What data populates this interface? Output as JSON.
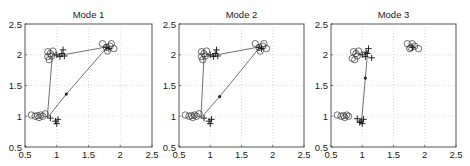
{
  "chart_data": [
    {
      "type": "scatter",
      "title": "Mode 1",
      "xlabel": "",
      "ylabel": "",
      "xlim": [
        0.5,
        2.5
      ],
      "ylim": [
        0.5,
        2.5
      ],
      "xticks": [
        "0.5",
        "1",
        "1.5",
        "2",
        "2.5"
      ],
      "yticks": [
        "0.5",
        "1",
        "1.5",
        "2",
        "2.5"
      ],
      "grid": true,
      "series": [
        {
          "name": "circles",
          "marker": "o",
          "points": [
            [
              0.6,
              1.02
            ],
            [
              0.66,
              1.0
            ],
            [
              0.7,
              1.01
            ],
            [
              0.72,
              0.98
            ],
            [
              0.75,
              1.02
            ],
            [
              0.78,
              1.0
            ],
            [
              0.82,
              1.04
            ],
            [
              0.86,
              2.05
            ],
            [
              0.88,
              1.92
            ],
            [
              0.9,
              2.02
            ],
            [
              0.92,
              1.98
            ],
            [
              0.94,
              2.06
            ],
            [
              0.86,
              1.97
            ],
            [
              1.72,
              2.18
            ],
            [
              1.78,
              2.12
            ],
            [
              1.84,
              2.14
            ],
            [
              1.9,
              2.1
            ],
            [
              1.8,
              2.06
            ],
            [
              1.86,
              2.18
            ]
          ]
        },
        {
          "name": "plus",
          "marker": "+",
          "points": [
            [
              0.9,
              0.97
            ],
            [
              0.98,
              0.92
            ],
            [
              1.0,
              0.88
            ],
            [
              1.02,
              0.95
            ],
            [
              1.0,
              2.0
            ],
            [
              1.05,
              1.97
            ],
            [
              1.08,
              2.02
            ],
            [
              1.1,
              2.08
            ],
            [
              1.12,
              1.98
            ],
            [
              1.78,
              2.12
            ],
            [
              1.82,
              2.1
            ]
          ]
        },
        {
          "name": "path",
          "marker": "-",
          "points": [
            [
              0.85,
              0.97
            ],
            [
              0.93,
              1.98
            ],
            [
              1.06,
              1.99
            ],
            [
              1.8,
              2.13
            ],
            [
              1.15,
              1.36
            ],
            [
              0.85,
              0.97
            ]
          ]
        },
        {
          "name": "midpoint",
          "marker": "*",
          "points": [
            [
              1.15,
              1.36
            ]
          ]
        }
      ]
    },
    {
      "type": "scatter",
      "title": "Mode 2",
      "xlabel": "",
      "ylabel": "",
      "xlim": [
        0.5,
        2.5
      ],
      "ylim": [
        0.5,
        2.5
      ],
      "xticks": [
        "0.5",
        "1",
        "1.5",
        "2",
        "2.5"
      ],
      "yticks": [
        "0.5",
        "1",
        "1.5",
        "2",
        "2.5"
      ],
      "grid": true,
      "series": [
        {
          "name": "circles",
          "marker": "o",
          "points": [
            [
              0.6,
              1.02
            ],
            [
              0.66,
              1.0
            ],
            [
              0.7,
              1.01
            ],
            [
              0.72,
              0.98
            ],
            [
              0.75,
              1.02
            ],
            [
              0.78,
              1.0
            ],
            [
              0.82,
              1.04
            ],
            [
              0.86,
              2.05
            ],
            [
              0.88,
              1.92
            ],
            [
              0.9,
              2.02
            ],
            [
              0.92,
              1.98
            ],
            [
              0.94,
              2.06
            ],
            [
              0.86,
              1.97
            ],
            [
              1.72,
              2.18
            ],
            [
              1.78,
              2.12
            ],
            [
              1.84,
              2.14
            ],
            [
              1.9,
              2.1
            ],
            [
              1.8,
              2.06
            ],
            [
              1.86,
              2.18
            ]
          ]
        },
        {
          "name": "plus",
          "marker": "+",
          "points": [
            [
              0.9,
              0.97
            ],
            [
              0.98,
              0.92
            ],
            [
              1.0,
              0.88
            ],
            [
              1.02,
              0.95
            ],
            [
              1.0,
              2.0
            ],
            [
              1.05,
              1.97
            ],
            [
              1.08,
              2.02
            ],
            [
              1.1,
              2.08
            ],
            [
              1.12,
              1.98
            ],
            [
              1.78,
              2.12
            ],
            [
              1.82,
              2.1
            ]
          ]
        },
        {
          "name": "path",
          "marker": "-",
          "points": [
            [
              0.85,
              0.97
            ],
            [
              0.9,
              1.97
            ],
            [
              1.06,
              1.99
            ],
            [
              1.8,
              2.13
            ],
            [
              1.15,
              1.32
            ],
            [
              0.85,
              0.97
            ]
          ]
        },
        {
          "name": "midpoint",
          "marker": "*",
          "points": [
            [
              1.15,
              1.32
            ]
          ]
        }
      ]
    },
    {
      "type": "scatter",
      "title": "Mode 3",
      "xlabel": "",
      "ylabel": "",
      "xlim": [
        0.5,
        2.5
      ],
      "ylim": [
        0.5,
        2.5
      ],
      "xticks": [
        "0.5",
        "1",
        "1.5",
        "2",
        "2.5"
      ],
      "yticks": [
        "0.5",
        "1",
        "1.5",
        "2",
        "2.5"
      ],
      "grid": true,
      "series": [
        {
          "name": "circles",
          "marker": "o",
          "points": [
            [
              0.6,
              1.02
            ],
            [
              0.66,
              1.0
            ],
            [
              0.7,
              1.01
            ],
            [
              0.72,
              0.98
            ],
            [
              0.75,
              1.02
            ],
            [
              0.78,
              1.0
            ],
            [
              0.86,
              2.05
            ],
            [
              0.88,
              1.92
            ],
            [
              0.9,
              2.02
            ],
            [
              0.92,
              1.98
            ],
            [
              0.94,
              2.06
            ],
            [
              0.84,
              1.94
            ],
            [
              1.72,
              2.18
            ],
            [
              1.78,
              2.12
            ],
            [
              1.84,
              2.14
            ],
            [
              1.9,
              2.1
            ],
            [
              1.8,
              2.18
            ],
            [
              1.76,
              2.1
            ]
          ]
        },
        {
          "name": "plus",
          "marker": "+",
          "points": [
            [
              0.92,
              0.96
            ],
            [
              0.98,
              0.92
            ],
            [
              1.0,
              0.88
            ],
            [
              1.02,
              0.95
            ],
            [
              0.96,
              0.9
            ],
            [
              1.0,
              2.0
            ],
            [
              1.05,
              1.97
            ],
            [
              1.08,
              2.02
            ],
            [
              1.1,
              2.1
            ],
            [
              1.15,
              1.95
            ],
            [
              1.06,
              2.04
            ],
            [
              1.8,
              2.12
            ]
          ]
        },
        {
          "name": "path",
          "marker": "-",
          "points": [
            [
              0.99,
              0.93
            ],
            [
              1.05,
              1.62
            ],
            [
              1.08,
              1.99
            ]
          ]
        },
        {
          "name": "midpoint",
          "marker": "*",
          "points": [
            [
              1.05,
              1.62
            ]
          ]
        }
      ]
    }
  ]
}
